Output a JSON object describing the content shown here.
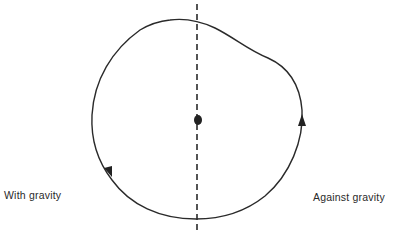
{
  "diagram": {
    "labels": {
      "left": "With gravity",
      "right": "Against gravity"
    },
    "elements": {
      "loop_path": "closed loop trajectory, circular on left/bottom, bulging outward upper-right",
      "axis": "vertical dashed line through center",
      "center_point": "filled dot at center",
      "arrows": [
        {
          "position": "lower-left",
          "direction": "down"
        },
        {
          "position": "right",
          "direction": "up"
        }
      ]
    },
    "colors": {
      "stroke": "#2a2a2a",
      "background": "#ffffff"
    }
  }
}
